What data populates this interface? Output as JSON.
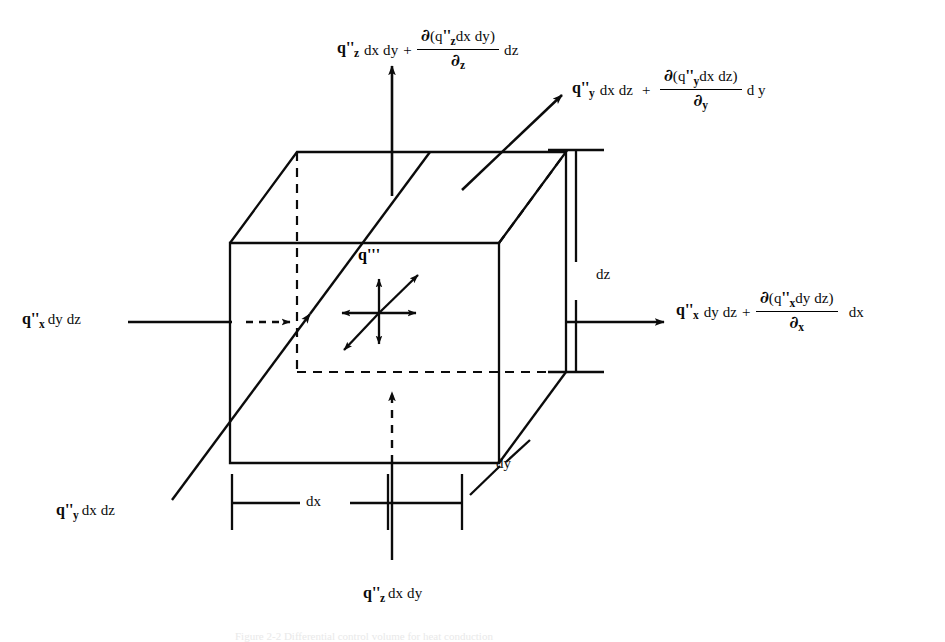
{
  "figure": {
    "caption": "Figure 2-2 Differential control volume for heat conduction"
  },
  "labels": {
    "top_out": {
      "name": "z-direction outgoing heat flux",
      "base_q": "q",
      "base_primes": "''",
      "base_sub": "z",
      "base_rest": "dx dy",
      "plus": "+",
      "num_del": "∂",
      "num_body": "(q",
      "num_primes": "''",
      "num_sub": "z",
      "num_tail": "dx dy)",
      "den_del": "∂",
      "den_sub": "z",
      "tail": "dz"
    },
    "right_up_out": {
      "name": "y-direction outgoing heat flux",
      "base_q": "q",
      "base_primes": "''",
      "base_sub": "y",
      "base_rest": "dx dz",
      "plus": "+",
      "num_del": "∂",
      "num_body": "(q",
      "num_primes": "''",
      "num_sub": "y",
      "num_tail": "dx dz)",
      "den_del": "∂",
      "den_sub": "y",
      "tail": "d y"
    },
    "right_out": {
      "name": "x-direction outgoing heat flux",
      "base_q": "q",
      "base_primes": "''",
      "base_sub": "x",
      "base_rest": "dy dz",
      "plus": "+",
      "num_del": "∂",
      "num_body": "(q",
      "num_primes": "''",
      "num_sub": "x",
      "num_tail": "dy dz)",
      "den_del": "∂",
      "den_sub": "x",
      "tail": "dx"
    },
    "left_in": {
      "name": "x-direction incoming heat flux",
      "q": "q",
      "primes": "''",
      "sub": "x",
      "rest": "dy dz"
    },
    "bottom_left_in": {
      "name": "y-direction incoming heat flux",
      "q": "q",
      "primes": "''",
      "sub": "y",
      "rest": "dx dz"
    },
    "bottom_in": {
      "name": "z-direction incoming heat flux",
      "q": "q",
      "primes": "''",
      "sub": "z",
      "rest": "dx dy"
    },
    "generation": {
      "name": "volumetric heat generation",
      "text": "q'''"
    }
  },
  "dimensions": {
    "dz": "dz",
    "dy": "dy",
    "dx": "dx"
  },
  "colors": {
    "ink": "#0b0b0b",
    "background": "#ffffff"
  }
}
